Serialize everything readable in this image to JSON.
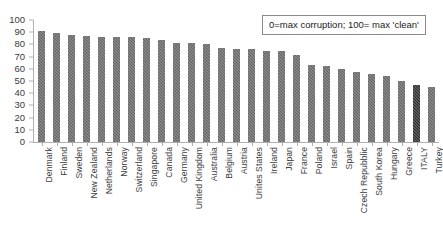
{
  "chart_data": {
    "type": "bar",
    "title": "",
    "subtitle": "",
    "xlabel": "",
    "ylabel": "",
    "ylim": [
      0,
      100
    ],
    "yticks": [
      0,
      10,
      20,
      30,
      40,
      50,
      60,
      70,
      80,
      90,
      100
    ],
    "grid": false,
    "legend_position": "top-right",
    "annotations": [
      "0=max corruption; 100= max 'clean'"
    ],
    "categories": [
      "Denmark",
      "Finland",
      "Sweden",
      "New Zealand",
      "Netherlands",
      "Norway",
      "Switzerland",
      "Singapore",
      "Canada",
      "Germany",
      "United Kingdom",
      "Australia",
      "Belgium",
      "Austria",
      "Unites States",
      "Ireland",
      "Japan",
      "France",
      "Poland",
      "Israel",
      "Spain",
      "Czech Repubblic",
      "South Korea",
      "Hungary",
      "Greece",
      "ITALY",
      "Turkey"
    ],
    "values": [
      91,
      89,
      88,
      87,
      86,
      86,
      86,
      85,
      84,
      81,
      81,
      80,
      77,
      76,
      76,
      75,
      75,
      71,
      63,
      62,
      60,
      57,
      56,
      54,
      50,
      47,
      45
    ],
    "highlight_category": "ITALY",
    "series": [
      {
        "name": "Corruption Perceptions Score",
        "values": [
          91,
          89,
          88,
          87,
          86,
          86,
          86,
          85,
          84,
          81,
          81,
          80,
          77,
          76,
          76,
          75,
          75,
          71,
          63,
          62,
          60,
          57,
          56,
          54,
          50,
          47,
          45
        ]
      }
    ],
    "colors": {
      "bar": "#636363",
      "bar_highlight": "#2b2b2b",
      "axis": "#b0b0b0",
      "text": "#3d3d3d",
      "background": "#ffffff"
    }
  },
  "legend": {
    "note": "0=max corruption; 100= max 'clean'"
  }
}
